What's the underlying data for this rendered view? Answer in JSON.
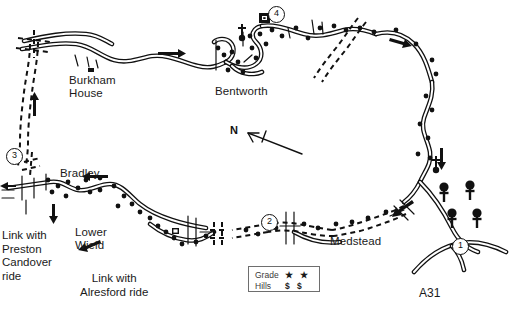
{
  "map": {
    "title": "Bentworth and Medstead cycle route map",
    "background_color": "#ffffff",
    "ink_color": "#111111",
    "width": 519,
    "height": 319,
    "places": [
      {
        "id": "burkham-house",
        "label": "Burkham\nHouse",
        "x": 69,
        "y": 74
      },
      {
        "id": "bentworth",
        "label": "Bentworth",
        "x": 215,
        "y": 85
      },
      {
        "id": "bradley",
        "label": "Bradley",
        "x": 60,
        "y": 167
      },
      {
        "id": "lower-wield",
        "label": "Lower\nWield",
        "x": 75,
        "y": 226
      },
      {
        "id": "medstead",
        "label": "Medstead",
        "x": 330,
        "y": 235
      }
    ],
    "link_labels": [
      {
        "id": "link-preston-candover",
        "label": "Link with\nPreston\nCandover\nride",
        "x": 2,
        "y": 229
      },
      {
        "id": "link-alresford",
        "label": "Link with\nAlresford ride",
        "x": 80,
        "y": 272
      }
    ],
    "road_labels": [
      {
        "id": "a31",
        "label": "A31",
        "x": 419,
        "y": 286
      }
    ],
    "compass": {
      "label": "N",
      "x": 230,
      "y": 124
    },
    "waypoints": [
      {
        "id": "waypoint-1",
        "label": "1",
        "x": 459,
        "y": 245
      },
      {
        "id": "waypoint-2",
        "label": "2",
        "x": 268,
        "y": 221
      },
      {
        "id": "waypoint-3",
        "label": "3",
        "x": 13,
        "y": 155
      },
      {
        "id": "waypoint-4",
        "label": "4",
        "x": 275,
        "y": 14
      }
    ],
    "legend": {
      "rows": [
        {
          "id": "grade",
          "key": "Grade",
          "symbols": "★ ★"
        },
        {
          "id": "hills",
          "key": "Hills",
          "symbols": "$ $"
        }
      ]
    }
  }
}
